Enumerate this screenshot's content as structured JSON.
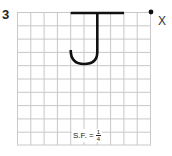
{
  "problem": {
    "number": "3",
    "point_label": "X",
    "scale_factor_label": "S.F. =",
    "scale_factor_numerator": "1",
    "scale_factor_denominator": "4"
  },
  "grid": {
    "columns": 10,
    "rows": 10,
    "line_color": "#c8c8c8"
  },
  "shape": {
    "type": "letter-J",
    "stroke_color": "#111111"
  }
}
